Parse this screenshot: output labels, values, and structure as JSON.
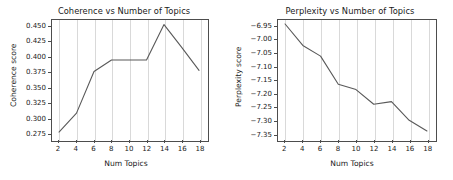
{
  "figure": {
    "background": "#ffffff",
    "line_color": "#595959",
    "grid_color": "#d9d9d9",
    "axis_color": "#4d4d4d"
  },
  "chart_data": [
    {
      "type": "line",
      "id": "coherence",
      "title": "Coherence vs Number of Topics",
      "xlabel": "Num Topics",
      "ylabel": "Coherence score",
      "x": [
        2,
        4,
        6,
        8,
        10,
        12,
        14,
        16,
        18
      ],
      "values": [
        0.277,
        0.308,
        0.376,
        0.395,
        0.395,
        0.395,
        0.453,
        0.416,
        0.378
      ],
      "categories": [
        "2",
        "4",
        "6",
        "8",
        "10",
        "12",
        "14",
        "16",
        "18"
      ],
      "xlim": [
        1.2,
        18.8
      ],
      "ylim": [
        0.2655,
        0.4605
      ],
      "xticks": [
        "2",
        "4",
        "6",
        "8",
        "10",
        "12",
        "14",
        "16",
        "18"
      ],
      "xtick_values": [
        2,
        4,
        6,
        8,
        10,
        12,
        14,
        16,
        18
      ],
      "yticks": [
        "0.275",
        "0.300",
        "0.325",
        "0.350",
        "0.375",
        "0.400",
        "0.425",
        "0.450"
      ],
      "ytick_values": [
        0.275,
        0.3,
        0.325,
        0.35,
        0.375,
        0.4,
        0.425,
        0.45
      ],
      "grid": "x-only",
      "legend": "none"
    },
    {
      "type": "line",
      "id": "perplexity",
      "title": "Perplexity vs Number of Topics",
      "xlabel": "Num Topics",
      "ylabel": "Perplexity score",
      "x": [
        2,
        4,
        6,
        8,
        10,
        12,
        14,
        16,
        18
      ],
      "values": [
        -6.94,
        -7.02,
        -7.06,
        -7.165,
        -7.185,
        -7.24,
        -7.23,
        -7.3,
        -7.34
      ],
      "categories": [
        "2",
        "4",
        "6",
        "8",
        "10",
        "12",
        "14",
        "16",
        "18"
      ],
      "xlim": [
        1.2,
        18.8
      ],
      "ylim": [
        -7.37,
        -6.925
      ],
      "xticks": [
        "2",
        "4",
        "6",
        "8",
        "10",
        "12",
        "14",
        "16",
        "18"
      ],
      "xtick_values": [
        2,
        4,
        6,
        8,
        10,
        12,
        14,
        16,
        18
      ],
      "yticks": [
        "−6.95",
        "−7.00",
        "−7.05",
        "−7.10",
        "−7.15",
        "−7.20",
        "−7.25",
        "−7.30",
        "−7.35"
      ],
      "ytick_values": [
        -6.95,
        -7.0,
        -7.05,
        -7.1,
        -7.15,
        -7.2,
        -7.25,
        -7.3,
        -7.35
      ],
      "grid": "x-only",
      "legend": "none"
    }
  ]
}
